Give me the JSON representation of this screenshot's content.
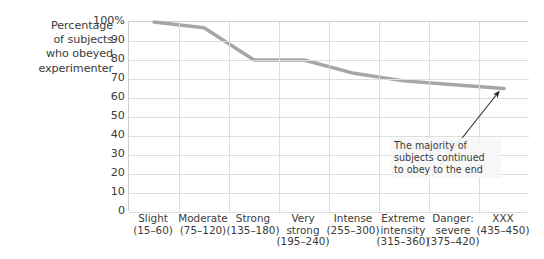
{
  "chart_data": {
    "type": "line",
    "title": "",
    "xlabel": "",
    "ylabel": "Percentage of subjects who obeyed experimenter",
    "ylim": [
      0,
      100
    ],
    "yticks": [
      "100%",
      "90",
      "80",
      "70",
      "60",
      "50",
      "40",
      "30",
      "20",
      "10",
      "0"
    ],
    "ytick_values": [
      100,
      90,
      80,
      70,
      60,
      50,
      40,
      30,
      20,
      10,
      0
    ],
    "grid": true,
    "legend": "none",
    "categories": [
      "Slight (15–60)",
      "Moderate (75–120)",
      "Strong (135–180)",
      "Very strong (195–240)",
      "Intense (255–300)",
      "Extreme intensity (315–360)",
      "Danger: severe (375–420)",
      "XXX (435–450)"
    ],
    "values": [
      100,
      97,
      80,
      80,
      73,
      69,
      67,
      65
    ],
    "series": [
      {
        "name": "Percentage who obeyed",
        "values": [
          100,
          97,
          80,
          80,
          73,
          69,
          67,
          65
        ],
        "color": "#a6a6a6"
      }
    ],
    "annotations": [
      {
        "text": [
          "The majority of",
          "subjects continued",
          "to obey to the end"
        ],
        "points_to_category": "XXX (435–450)",
        "points_to_value": 65
      }
    ]
  },
  "axis": {
    "y_title_lines": [
      "Percentage",
      "of subjects",
      "who obeyed",
      "experimenter"
    ],
    "x_labels": [
      {
        "name": "Slight",
        "range": "(15–60)",
        "stacked": false
      },
      {
        "name": "Moderate",
        "range": "(75–120)",
        "stacked": false
      },
      {
        "name": "Strong",
        "range": "(135–180)",
        "stacked": false
      },
      {
        "name": "Very",
        "name2": "strong",
        "range": "(195–240)",
        "stacked": true
      },
      {
        "name": "Intense",
        "range": "(255–300)",
        "stacked": false
      },
      {
        "name": "Extreme",
        "name2": "intensity",
        "range": "(315–360)",
        "stacked": true
      },
      {
        "name": "Danger:",
        "name2": "severe",
        "range": "(375–420)",
        "stacked": true
      },
      {
        "name": "XXX",
        "range": "(435–450)",
        "stacked": false
      }
    ]
  },
  "colors": {
    "line": "#a6a6a6",
    "grid": "#dddddd",
    "axis": "#cfcfcf",
    "text": "#3b3b3b",
    "background": "#ffffff",
    "annotation_bg": "#f6f6f6",
    "arrow": "#2b2b2b"
  }
}
